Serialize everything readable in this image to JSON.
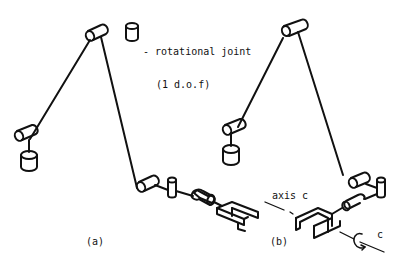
{
  "legend": {
    "symbol": "cylinder-joint-icon",
    "line1": "- rotational joint",
    "line2": "(1 d.o.f)"
  },
  "panels": [
    {
      "label": "(a)"
    },
    {
      "label": "(b)"
    }
  ],
  "annotations": {
    "axis_label": "axis c",
    "rotation_label": "c"
  },
  "colors": {
    "ink": "#111111",
    "background": "#ffffff"
  }
}
